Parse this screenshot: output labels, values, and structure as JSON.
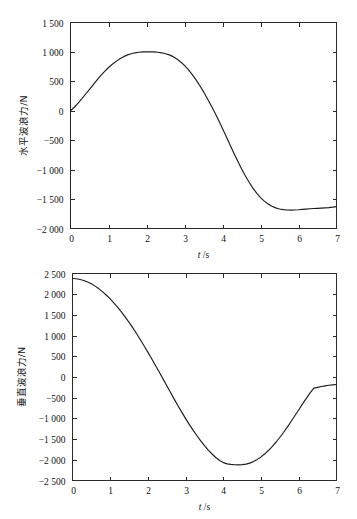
{
  "page": {
    "background_color": "#ffffff",
    "ink_color": "#1d1d1d"
  },
  "chart_data": [
    {
      "id": "horizontal-wave-force",
      "type": "line",
      "title": "",
      "xlabel": "t /s",
      "xlabel_symbol": "t",
      "xlabel_unit": "/s",
      "ylabel": "水平波浪力/N",
      "xlim": [
        0,
        7
      ],
      "ylim": [
        -2000,
        1500
      ],
      "grid": false,
      "legend": null,
      "xticks": [
        0,
        1,
        2,
        3,
        4,
        5,
        6,
        7
      ],
      "xticklabels": [
        "0",
        "1",
        "2",
        "3",
        "4",
        "5",
        "6",
        "7"
      ],
      "yticks": [
        -2000,
        -1500,
        -1000,
        -500,
        0,
        500,
        1000,
        1500
      ],
      "yticklabels": [
        "−2 000",
        "−1 500",
        "−1 000",
        "−500",
        "0",
        "500",
        "1 000",
        "1 500"
      ],
      "series": [
        {
          "name": "horizontal wave force",
          "x": [
            0.0,
            0.1,
            0.2,
            0.3,
            0.4,
            0.5,
            0.6,
            0.7,
            0.8,
            0.9,
            1.0,
            1.1,
            1.2,
            1.3,
            1.4,
            1.5,
            1.6,
            1.7,
            1.8,
            1.9,
            2.0,
            2.1,
            2.2,
            2.3,
            2.4,
            2.5,
            2.6,
            2.7,
            2.8,
            2.9,
            3.0,
            3.1,
            3.2,
            3.3,
            3.4,
            3.5,
            3.6,
            3.7,
            3.8,
            3.9,
            4.0,
            4.1,
            4.2,
            4.3,
            4.4,
            4.5,
            4.6,
            4.7,
            4.8,
            4.9,
            5.0,
            5.1,
            5.2,
            5.3,
            5.4,
            5.5,
            5.6,
            5.7,
            5.8,
            5.9,
            6.0,
            6.1,
            6.2,
            6.3,
            6.4,
            6.5,
            6.6,
            6.7,
            6.8,
            6.9,
            7.0
          ],
          "y": [
            0,
            60,
            130,
            205,
            285,
            365,
            445,
            525,
            600,
            670,
            735,
            790,
            840,
            885,
            920,
            950,
            970,
            985,
            995,
            1000,
            1002,
            1002,
            1000,
            995,
            985,
            970,
            950,
            920,
            880,
            830,
            770,
            700,
            620,
            530,
            430,
            325,
            210,
            90,
            -35,
            -165,
            -300,
            -440,
            -580,
            -720,
            -855,
            -985,
            -1105,
            -1215,
            -1315,
            -1400,
            -1475,
            -1535,
            -1585,
            -1622,
            -1650,
            -1668,
            -1680,
            -1686,
            -1688,
            -1686,
            -1682,
            -1676,
            -1670,
            -1665,
            -1660,
            -1657,
            -1654,
            -1650,
            -1645,
            -1638,
            -1628
          ]
        }
      ]
    },
    {
      "id": "vertical-wave-force",
      "type": "line",
      "title": "",
      "xlabel": "t /s",
      "xlabel_symbol": "t",
      "xlabel_unit": "/s",
      "ylabel": "垂直波浪力/N",
      "xlim": [
        0,
        7
      ],
      "ylim": [
        -2500,
        2500
      ],
      "grid": false,
      "legend": null,
      "xticks": [
        0,
        1,
        2,
        3,
        4,
        5,
        6,
        7
      ],
      "xticklabels": [
        "0",
        "1",
        "2",
        "3",
        "4",
        "5",
        "6",
        "7"
      ],
      "yticks": [
        -2500,
        -2000,
        -1500,
        -1000,
        -500,
        0,
        500,
        1000,
        1500,
        2000,
        2500
      ],
      "yticklabels": [
        "−2 500",
        "−2 000",
        "−1 500",
        "−1 000",
        "−500",
        "0",
        "500",
        "1 000",
        "1 500",
        "2 000",
        "2 500"
      ],
      "series": [
        {
          "name": "vertical wave force",
          "x": [
            0.0,
            0.1,
            0.2,
            0.3,
            0.4,
            0.5,
            0.6,
            0.7,
            0.8,
            0.9,
            1.0,
            1.1,
            1.2,
            1.3,
            1.4,
            1.5,
            1.6,
            1.7,
            1.8,
            1.9,
            2.0,
            2.1,
            2.2,
            2.3,
            2.4,
            2.5,
            2.6,
            2.7,
            2.8,
            2.9,
            3.0,
            3.1,
            3.2,
            3.3,
            3.4,
            3.5,
            3.6,
            3.7,
            3.8,
            3.9,
            4.0,
            4.1,
            4.2,
            4.3,
            4.4,
            4.5,
            4.6,
            4.7,
            4.8,
            4.9,
            5.0,
            5.1,
            5.2,
            5.3,
            5.4,
            5.5,
            5.6,
            5.7,
            5.8,
            5.9,
            6.0,
            6.1,
            6.2,
            6.3,
            6.4,
            6.5,
            6.6,
            6.7,
            6.8,
            6.9,
            7.0
          ],
          "y": [
            2380,
            2372,
            2355,
            2330,
            2295,
            2250,
            2195,
            2130,
            2055,
            1975,
            1885,
            1785,
            1680,
            1565,
            1445,
            1320,
            1185,
            1045,
            900,
            750,
            595,
            440,
            280,
            120,
            -45,
            -210,
            -375,
            -540,
            -700,
            -855,
            -1005,
            -1150,
            -1290,
            -1420,
            -1545,
            -1660,
            -1765,
            -1860,
            -1945,
            -2015,
            -2068,
            -2098,
            -2112,
            -2120,
            -2122,
            -2118,
            -2105,
            -2080,
            -2040,
            -1990,
            -1930,
            -1855,
            -1770,
            -1675,
            -1570,
            -1455,
            -1335,
            -1205,
            -1070,
            -930,
            -790,
            -650,
            -515,
            -385,
            -270,
            -250,
            -230,
            -215,
            -200,
            -190,
            -180
          ]
        }
      ]
    }
  ]
}
